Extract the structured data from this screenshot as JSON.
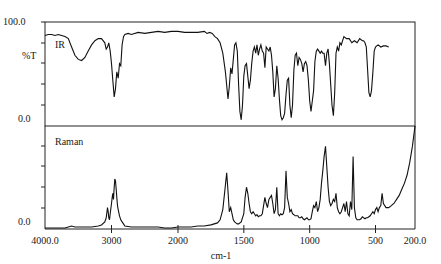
{
  "chart_data": [
    {
      "type": "line",
      "title": "IR",
      "panel_label": "IR",
      "ylabel": "%T",
      "xlabel": "cm-1",
      "ylim": [
        0.0,
        100.0
      ],
      "y_tick_labels": [
        "100.0",
        "0.0"
      ],
      "xlim": [
        4000.0,
        200.0
      ],
      "x_scale": "split: 4000-2000 compressed, 2000-200 expanded 2x",
      "grid": false,
      "x": [
        4000,
        3950,
        3900,
        3850,
        3800,
        3750,
        3700,
        3650,
        3600,
        3550,
        3500,
        3450,
        3400,
        3350,
        3300,
        3250,
        3200,
        3150,
        3100,
        3080,
        3060,
        3040,
        3020,
        3000,
        2980,
        2960,
        2940,
        2920,
        2900,
        2880,
        2860,
        2840,
        2820,
        2800,
        2750,
        2700,
        2600,
        2500,
        2400,
        2300,
        2200,
        2100,
        2000,
        1950,
        1900,
        1850,
        1800,
        1780,
        1760,
        1740,
        1720,
        1700,
        1680,
        1660,
        1640,
        1620,
        1610,
        1600,
        1590,
        1580,
        1570,
        1560,
        1550,
        1540,
        1530,
        1520,
        1510,
        1500,
        1490,
        1480,
        1470,
        1460,
        1450,
        1440,
        1430,
        1420,
        1410,
        1400,
        1390,
        1380,
        1370,
        1360,
        1350,
        1340,
        1330,
        1320,
        1310,
        1300,
        1290,
        1280,
        1270,
        1260,
        1250,
        1240,
        1230,
        1220,
        1210,
        1200,
        1190,
        1180,
        1170,
        1160,
        1150,
        1140,
        1130,
        1120,
        1110,
        1100,
        1090,
        1080,
        1070,
        1060,
        1050,
        1040,
        1030,
        1020,
        1010,
        1000,
        990,
        980,
        970,
        960,
        950,
        940,
        930,
        920,
        910,
        900,
        890,
        880,
        870,
        860,
        850,
        840,
        830,
        820,
        810,
        800,
        790,
        780,
        770,
        760,
        750,
        740,
        720,
        700,
        680,
        660,
        640,
        620,
        600,
        590,
        580,
        570,
        560,
        550,
        540,
        530,
        520,
        510,
        500,
        490,
        480,
        460,
        440,
        420,
        400
      ],
      "values": [
        87,
        88,
        88,
        87,
        88,
        87,
        86,
        84,
        76,
        68,
        64,
        63,
        66,
        72,
        78,
        82,
        84,
        84,
        80,
        74,
        76,
        80,
        72,
        60,
        44,
        28,
        36,
        52,
        46,
        60,
        58,
        78,
        86,
        88,
        89,
        88,
        90,
        89,
        90,
        91,
        90,
        91,
        91,
        90,
        90,
        90,
        91,
        89,
        90,
        89,
        86,
        84,
        80,
        70,
        52,
        26,
        38,
        56,
        50,
        64,
        78,
        80,
        72,
        40,
        14,
        6,
        20,
        48,
        58,
        60,
        48,
        36,
        44,
        60,
        72,
        76,
        70,
        78,
        68,
        74,
        78,
        72,
        70,
        56,
        76,
        74,
        72,
        76,
        68,
        52,
        28,
        36,
        58,
        46,
        26,
        10,
        6,
        8,
        12,
        30,
        44,
        46,
        20,
        8,
        20,
        54,
        68,
        70,
        58,
        66,
        64,
        60,
        52,
        60,
        62,
        58,
        44,
        24,
        14,
        24,
        34,
        62,
        72,
        74,
        72,
        70,
        72,
        70,
        70,
        58,
        70,
        74,
        60,
        40,
        20,
        10,
        32,
        70,
        76,
        72,
        80,
        78,
        82,
        86,
        84,
        84,
        80,
        82,
        80,
        84,
        82,
        82,
        80,
        76,
        54,
        32,
        28,
        34,
        52,
        72,
        76,
        77,
        78,
        76,
        77,
        77,
        76,
        75,
        74
      ]
    },
    {
      "type": "line",
      "title": "Raman",
      "panel_label": "Raman",
      "ylabel": "",
      "xlabel": "cm-1",
      "ylim": [
        0.0,
        100.0
      ],
      "y_tick_labels": [
        "0.0"
      ],
      "xlim": [
        4000.0,
        200.0
      ],
      "grid": false,
      "x": [
        4000,
        3800,
        3700,
        3650,
        3600,
        3550,
        3500,
        3400,
        3300,
        3200,
        3150,
        3100,
        3080,
        3060,
        3050,
        3040,
        3030,
        3020,
        3000,
        2990,
        2980,
        2970,
        2960,
        2950,
        2940,
        2930,
        2920,
        2910,
        2900,
        2880,
        2860,
        2840,
        2820,
        2800,
        2700,
        2600,
        2500,
        2400,
        2300,
        2200,
        2100,
        2000,
        1950,
        1900,
        1850,
        1800,
        1750,
        1700,
        1680,
        1660,
        1640,
        1630,
        1620,
        1610,
        1600,
        1590,
        1580,
        1570,
        1560,
        1550,
        1540,
        1520,
        1500,
        1490,
        1480,
        1470,
        1460,
        1450,
        1440,
        1430,
        1420,
        1410,
        1400,
        1390,
        1380,
        1370,
        1360,
        1350,
        1340,
        1330,
        1320,
        1310,
        1300,
        1290,
        1280,
        1270,
        1260,
        1250,
        1240,
        1230,
        1220,
        1210,
        1200,
        1190,
        1180,
        1170,
        1160,
        1150,
        1140,
        1130,
        1120,
        1110,
        1100,
        1090,
        1080,
        1070,
        1060,
        1050,
        1040,
        1030,
        1020,
        1010,
        1000,
        990,
        980,
        970,
        960,
        950,
        940,
        930,
        920,
        910,
        900,
        890,
        880,
        870,
        860,
        850,
        840,
        830,
        820,
        810,
        800,
        790,
        780,
        770,
        760,
        750,
        740,
        730,
        720,
        710,
        700,
        690,
        680,
        670,
        660,
        650,
        640,
        630,
        620,
        610,
        600,
        590,
        580,
        570,
        560,
        550,
        540,
        530,
        520,
        510,
        500,
        490,
        480,
        470,
        460,
        450,
        440,
        420,
        400,
        380,
        360,
        340,
        320,
        300,
        280,
        260,
        240,
        220,
        200
      ],
      "values": [
        0,
        0,
        0,
        1,
        2,
        1,
        1,
        1,
        1,
        2,
        3,
        6,
        10,
        20,
        16,
        10,
        8,
        14,
        24,
        30,
        34,
        28,
        40,
        48,
        46,
        38,
        30,
        22,
        18,
        12,
        8,
        6,
        4,
        2,
        1,
        1,
        1,
        1,
        1,
        0,
        0,
        1,
        1,
        1,
        2,
        2,
        3,
        5,
        8,
        18,
        42,
        54,
        36,
        16,
        20,
        14,
        8,
        6,
        5,
        4,
        4,
        6,
        14,
        30,
        40,
        34,
        24,
        16,
        14,
        16,
        14,
        12,
        13,
        11,
        12,
        12,
        14,
        22,
        30,
        24,
        20,
        28,
        30,
        32,
        24,
        14,
        18,
        40,
        14,
        12,
        14,
        13,
        14,
        20,
        56,
        30,
        24,
        16,
        18,
        14,
        13,
        12,
        12,
        12,
        10,
        10,
        11,
        9,
        8,
        9,
        10,
        8,
        8,
        9,
        16,
        22,
        20,
        26,
        16,
        20,
        28,
        44,
        56,
        70,
        80,
        60,
        40,
        26,
        22,
        24,
        28,
        26,
        34,
        20,
        16,
        14,
        16,
        20,
        24,
        16,
        26,
        14,
        12,
        26,
        18,
        70,
        20,
        10,
        8,
        8,
        8,
        9,
        11,
        10,
        9,
        10,
        10,
        11,
        12,
        14,
        16,
        14,
        18,
        20,
        16,
        20,
        22,
        34,
        24,
        20,
        20,
        22,
        24,
        28,
        32,
        38,
        44,
        52,
        64,
        80,
        100
      ]
    }
  ],
  "axes": {
    "ir_y_top": "100.0",
    "ir_y_bottom": "0.0",
    "ir_y_label": "%T",
    "raman_y_bottom": "0.0",
    "x_ticks": [
      "4000.0",
      "3000",
      "2000",
      "1500",
      "1000",
      "500",
      "200.0"
    ],
    "x_label": "cm-1"
  },
  "panels": {
    "ir_label": "IR",
    "raman_label": "Raman"
  }
}
